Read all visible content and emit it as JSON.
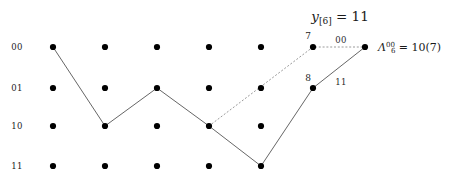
{
  "figure": {
    "title": {
      "var": "y",
      "sub": "[6]",
      "eq": " = 11",
      "full": "y[6] = 11"
    },
    "row_labels": [
      "00",
      "01",
      "10",
      "11"
    ],
    "columns": 7,
    "grid": {
      "col_x": [
        53,
        105,
        157,
        209,
        261,
        313,
        365
      ],
      "row_y": [
        47,
        88,
        126,
        166
      ],
      "row_dots_present": [
        [
          true,
          true,
          true,
          true,
          true,
          true,
          true
        ],
        [
          true,
          true,
          true,
          true,
          true,
          true,
          false
        ],
        [
          true,
          true,
          true,
          true,
          true,
          false,
          false
        ],
        [
          true,
          true,
          true,
          true,
          true,
          false,
          false
        ]
      ]
    },
    "solid_path": {
      "label": "survivor-path",
      "nodes": [
        {
          "col": 0,
          "row": 0
        },
        {
          "col": 1,
          "row": 2
        },
        {
          "col": 2,
          "row": 1
        },
        {
          "col": 3,
          "row": 2
        },
        {
          "col": 4,
          "row": 3
        },
        {
          "col": 5,
          "row": 1
        },
        {
          "col": 6,
          "row": 0
        }
      ]
    },
    "dotted_path": {
      "label": "alternative-path",
      "nodes": [
        {
          "col": 3,
          "row": 2
        },
        {
          "col": 5,
          "row": 0
        },
        {
          "col": 6,
          "row": 0
        }
      ]
    },
    "node_numbers": [
      {
        "text": "7",
        "x": 308,
        "y": 36
      },
      {
        "text": "8",
        "x": 308,
        "y": 78
      }
    ],
    "edge_labels": [
      {
        "text": "00",
        "x": 341,
        "y": 40
      },
      {
        "text": "11",
        "x": 341,
        "y": 82
      }
    ],
    "lambda_label": {
      "symbol": "Λ",
      "sub": "6",
      "sup": "00",
      "eq": " = 10(7)",
      "x": 378,
      "y": 48,
      "full": "Λ6^00 = 10(7)"
    },
    "colors": {
      "background": "#ffffff",
      "dot": "#000000",
      "solid_edge": "#555555",
      "dotted_edge": "#9a9a9a",
      "text": "#1a1a1a"
    }
  }
}
